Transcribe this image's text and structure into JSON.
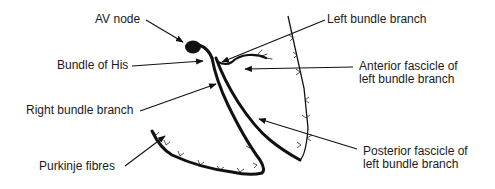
{
  "diagram": {
    "type": "cardiac-conduction-system",
    "line_color": "#111111",
    "background": "#ffffff",
    "labels": {
      "av_node": "AV node",
      "bundle_of_his": "Bundle of His",
      "right_bundle_branch": "Right bundle branch",
      "purkinje_fibres": "Purkinje fibres",
      "left_bundle_branch": "Left bundle branch",
      "anterior_fascicle_line1": "Anterior fascicle of",
      "anterior_fascicle_line2": "left bundle branch",
      "posterior_fascicle_line1": "Posterior fascicle of",
      "posterior_fascicle_line2": "left bundle branch"
    }
  }
}
